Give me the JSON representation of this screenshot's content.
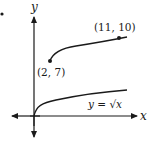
{
  "figure": {
    "bullet": "•",
    "axes": {
      "x_label": "x",
      "y_label": "y"
    },
    "curves": [
      {
        "name": "parent",
        "equation_label": "y = √x",
        "equation_lhs": "y = ",
        "equation_rhs": "√x"
      },
      {
        "name": "transformed",
        "start_point_label": "(2, 7)",
        "end_point_label": "(11, 10)"
      }
    ],
    "colors": {
      "stroke": "#1a1a1a",
      "background": "#ffffff"
    }
  }
}
